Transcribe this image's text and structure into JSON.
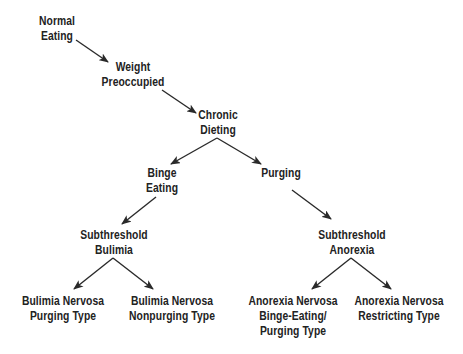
{
  "diagram": {
    "type": "flow-tree",
    "colors": {
      "text": "#222222",
      "arrow": "#2a2a2a",
      "background": "#ffffff"
    },
    "nodes": [
      {
        "id": "normal-eating",
        "lines": [
          "Normal",
          "Eating"
        ],
        "cx": 57,
        "top": 14
      },
      {
        "id": "weight-preoccupied",
        "lines": [
          "Weight",
          "Preoccupied"
        ],
        "cx": 133,
        "top": 60
      },
      {
        "id": "chronic-dieting",
        "lines": [
          "Chronic",
          "Dieting"
        ],
        "cx": 218,
        "top": 108
      },
      {
        "id": "binge-eating",
        "lines": [
          "Binge",
          "Eating"
        ],
        "cx": 162,
        "top": 166
      },
      {
        "id": "purging",
        "lines": [
          "Purging"
        ],
        "cx": 281,
        "top": 166
      },
      {
        "id": "subthreshold-bulimia",
        "lines": [
          "Subthreshold",
          "Bulimia"
        ],
        "cx": 114,
        "top": 228
      },
      {
        "id": "subthreshold-anorexia",
        "lines": [
          "Subthreshold",
          "Anorexia"
        ],
        "cx": 352,
        "top": 228
      },
      {
        "id": "bulimia-nervosa-purging",
        "lines": [
          "Bulimia Nervosa",
          "Purging Type"
        ],
        "cx": 63,
        "top": 294
      },
      {
        "id": "bulimia-nervosa-nonpurging",
        "lines": [
          "Bulimia Nervosa",
          "Nonpurging Type"
        ],
        "cx": 172,
        "top": 294
      },
      {
        "id": "anorexia-nervosa-binge-purging",
        "lines": [
          "Anorexia Nervosa",
          "Binge-Eating/",
          "Purging Type"
        ],
        "cx": 293,
        "top": 294
      },
      {
        "id": "anorexia-nervosa-restricting",
        "lines": [
          "Anorexia Nervosa",
          "Restricting Type"
        ],
        "cx": 399,
        "top": 294
      }
    ],
    "edges": [
      {
        "from": "normal-eating",
        "to": "weight-preoccupied",
        "x1": 76,
        "y1": 40,
        "x2": 108,
        "y2": 62
      },
      {
        "from": "weight-preoccupied",
        "to": "chronic-dieting",
        "x1": 162,
        "y1": 90,
        "x2": 196,
        "y2": 113
      },
      {
        "from": "chronic-dieting",
        "to": "binge-eating",
        "x1": 217,
        "y1": 138,
        "x2": 171,
        "y2": 164
      },
      {
        "from": "chronic-dieting",
        "to": "purging",
        "x1": 217,
        "y1": 138,
        "x2": 261,
        "y2": 164
      },
      {
        "from": "binge-eating",
        "to": "subthreshold-bulimia",
        "x1": 156,
        "y1": 197,
        "x2": 122,
        "y2": 224
      },
      {
        "from": "purging",
        "to": "subthreshold-anorexia",
        "x1": 292,
        "y1": 190,
        "x2": 331,
        "y2": 219
      },
      {
        "from": "subthreshold-bulimia",
        "to": "bulimia-nervosa-purging",
        "x1": 113,
        "y1": 258,
        "x2": 74,
        "y2": 289
      },
      {
        "from": "subthreshold-bulimia",
        "to": "bulimia-nervosa-nonpurging",
        "x1": 113,
        "y1": 258,
        "x2": 153,
        "y2": 289
      },
      {
        "from": "subthreshold-anorexia",
        "to": "anorexia-nervosa-binge-purging",
        "x1": 351,
        "y1": 258,
        "x2": 312,
        "y2": 289
      },
      {
        "from": "subthreshold-anorexia",
        "to": "anorexia-nervosa-restricting",
        "x1": 351,
        "y1": 258,
        "x2": 391,
        "y2": 289
      }
    ]
  }
}
